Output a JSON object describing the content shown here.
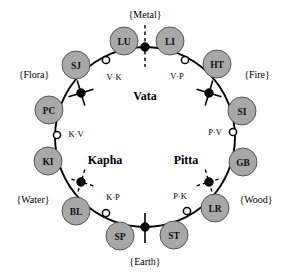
{
  "diagram": {
    "geometry": {
      "cx": 145,
      "cy": 137,
      "r": 90
    },
    "colors": {
      "organ_fill": "#a8a8a8",
      "organ_stroke": "#4a4a4a",
      "ring_stroke": "#000000",
      "node_filled": "#000000",
      "node_open": "#ffffff",
      "background": "#ffffff"
    },
    "dosha_labels": [
      {
        "name": "vata",
        "text": "Vata",
        "x": 145,
        "y": 96
      },
      {
        "name": "kapha",
        "text": "Kapha",
        "x": 105,
        "y": 160
      },
      {
        "name": "pitta",
        "text": "Pitta",
        "x": 186,
        "y": 160
      }
    ],
    "element_nodes": [
      {
        "name": "metal",
        "text": "{Metal}",
        "label_x": 145,
        "label_y": 14,
        "node_x": 145,
        "node_y": 47,
        "marker": "dashed-vertical",
        "angle": 270
      },
      {
        "name": "fire",
        "text": "{Fire}",
        "label_x": 257,
        "label_y": 74,
        "node_x": 209,
        "node_y": 93,
        "marker": "solid-cross",
        "angle": 332
      },
      {
        "name": "wood",
        "text": "{Wood}",
        "label_x": 256,
        "label_y": 199,
        "node_x": 209,
        "node_y": 182,
        "marker": "dashed-cross",
        "angle": 28
      },
      {
        "name": "earth",
        "text": "{Earth}",
        "label_x": 145,
        "label_y": 261,
        "node_x": 145,
        "node_y": 227,
        "marker": "solid-vertical",
        "angle": 90
      },
      {
        "name": "water",
        "text": "{Water}",
        "label_x": 33,
        "label_y": 199,
        "node_x": 81,
        "node_y": 182,
        "marker": "dashed-cross",
        "angle": 152
      },
      {
        "name": "flora",
        "text": "{Flora}",
        "label_x": 34,
        "label_y": 74,
        "node_x": 81,
        "node_y": 93,
        "marker": "solid-cross",
        "angle": 208
      }
    ],
    "junction_nodes": [
      {
        "name": "v-p",
        "text": "V·P",
        "node_x": 185,
        "node_y": 60,
        "label_x": 177,
        "label_y": 76,
        "anchor": "middle"
      },
      {
        "name": "p-v",
        "text": "P·V",
        "node_x": 233,
        "node_y": 132,
        "label_x": 215,
        "label_y": 132,
        "anchor": "middle"
      },
      {
        "name": "p-k",
        "text": "P·K",
        "node_x": 187,
        "node_y": 211,
        "label_x": 180,
        "label_y": 196,
        "anchor": "middle"
      },
      {
        "name": "k-p",
        "text": "K·P",
        "node_x": 106,
        "node_y": 213,
        "label_x": 113,
        "label_y": 197,
        "anchor": "middle"
      },
      {
        "name": "k-v",
        "text": "K·V",
        "node_x": 57,
        "node_y": 135,
        "label_x": 76,
        "label_y": 134,
        "anchor": "middle"
      },
      {
        "name": "v-k",
        "text": "V·K",
        "node_x": 106,
        "node_y": 60,
        "label_x": 114,
        "label_y": 77,
        "anchor": "middle"
      }
    ],
    "organs": [
      {
        "name": "lu",
        "text": "LU",
        "x": 124,
        "y": 41,
        "r": 14
      },
      {
        "name": "li",
        "text": "LI",
        "x": 170,
        "y": 41,
        "r": 14
      },
      {
        "name": "ht",
        "text": "HT",
        "x": 217,
        "y": 64,
        "r": 14
      },
      {
        "name": "si",
        "text": "SI",
        "x": 242,
        "y": 111,
        "r": 14
      },
      {
        "name": "gb",
        "text": "GB",
        "x": 243,
        "y": 162,
        "r": 14
      },
      {
        "name": "lr",
        "text": "LR",
        "x": 215,
        "y": 208,
        "r": 14
      },
      {
        "name": "st",
        "text": "ST",
        "x": 174,
        "y": 235,
        "r": 14
      },
      {
        "name": "sp",
        "text": "SP",
        "x": 120,
        "y": 236,
        "r": 14
      },
      {
        "name": "bl",
        "text": "BL",
        "x": 76,
        "y": 211,
        "r": 14
      },
      {
        "name": "ki",
        "text": "KI",
        "x": 48,
        "y": 161,
        "r": 14
      },
      {
        "name": "pc",
        "text": "PC",
        "x": 49,
        "y": 110,
        "r": 14
      },
      {
        "name": "sj",
        "text": "SJ",
        "x": 76,
        "y": 65,
        "r": 14
      }
    ]
  }
}
